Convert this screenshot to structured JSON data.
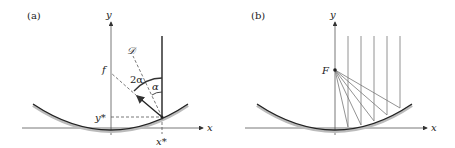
{
  "panels": [
    {
      "label": "(a)",
      "axes": {
        "x": "x",
        "y": "y"
      },
      "annotations": {
        "f": "f",
        "D": "𝒟",
        "two_alpha": "2α",
        "alpha": "α",
        "y_star": "y*",
        "x_star": "x*"
      }
    },
    {
      "label": "(b)",
      "axes": {
        "x": "x",
        "y": "y"
      },
      "annotations": {
        "F": "F"
      }
    }
  ]
}
